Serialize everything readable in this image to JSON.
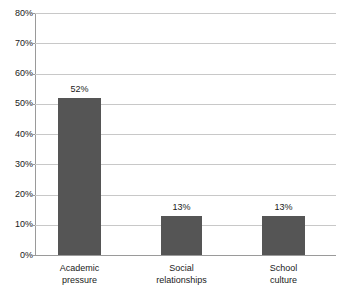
{
  "chart_data": {
    "type": "bar",
    "title": "",
    "subtitle": "",
    "xlabel": "",
    "ylabel": "",
    "categories": [
      "Academic pressure",
      "Social relationships",
      "School culture"
    ],
    "category_lines": [
      [
        "Academic",
        "pressure"
      ],
      [
        "Social",
        "relationships"
      ],
      [
        "School",
        "culture"
      ]
    ],
    "values": [
      52,
      13,
      13
    ],
    "value_labels": [
      "52%",
      "13%",
      "13%"
    ],
    "ylim": [
      0,
      80
    ],
    "ytick_values": [
      0,
      10,
      20,
      30,
      40,
      50,
      60,
      70,
      80
    ],
    "ytick_labels": [
      "0%",
      "10%",
      "20%",
      "30%",
      "40%",
      "50%",
      "60%",
      "70%",
      "80%"
    ],
    "grid": true,
    "legend": false,
    "legend_position": "none",
    "bar_color": "#555555",
    "gridline_color": "#c8c8c8",
    "axis_color": "#9a9a9a",
    "text_color": "#1a1a1a",
    "background_color": "#ffffff"
  }
}
